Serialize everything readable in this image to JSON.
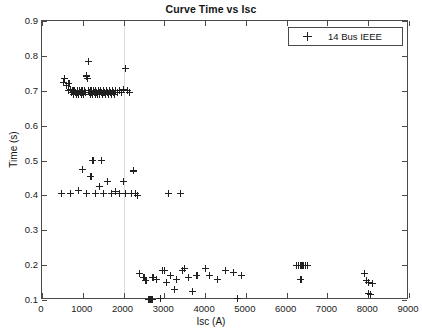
{
  "chart_data": {
    "type": "scatter",
    "title": "Curve Time vs Isc",
    "xlabel": "Isc (A)",
    "ylabel": "Time (s)",
    "xlim": [
      0,
      9000
    ],
    "ylim": [
      0.1,
      0.9
    ],
    "xticks": [
      0,
      1000,
      2000,
      3000,
      4000,
      5000,
      6000,
      7000,
      8000,
      9000
    ],
    "yticks": [
      0.1,
      0.2,
      0.3,
      0.4,
      0.5,
      0.6,
      0.7,
      0.8,
      0.9
    ],
    "xtick_labels": [
      "0",
      "1000",
      "2000",
      "3000",
      "4000",
      "5000",
      "6000",
      "7000",
      "8000",
      "9000"
    ],
    "ytick_labels": [
      "0.1",
      "0.2",
      "0.3",
      "0.4",
      "0.5",
      "0.6",
      "0.7",
      "0.8",
      "0.9"
    ],
    "grid": false,
    "gridlines_x": [
      2000
    ],
    "legend_position": "upper right",
    "marker": "+",
    "marker_color": "#202020",
    "series": [
      {
        "name": "14 Bus IEEE",
        "points": [
          [
            470,
            0.405
          ],
          [
            520,
            0.725
          ],
          [
            560,
            0.735
          ],
          [
            600,
            0.715
          ],
          [
            640,
            0.7
          ],
          [
            660,
            0.72
          ],
          [
            700,
            0.705
          ],
          [
            700,
            0.405
          ],
          [
            730,
            0.695
          ],
          [
            760,
            0.7
          ],
          [
            780,
            0.69
          ],
          [
            800,
            0.7
          ],
          [
            820,
            0.695
          ],
          [
            840,
            0.69
          ],
          [
            860,
            0.7
          ],
          [
            880,
            0.695
          ],
          [
            900,
            0.69
          ],
          [
            900,
            0.415
          ],
          [
            920,
            0.7
          ],
          [
            940,
            0.695
          ],
          [
            960,
            0.69
          ],
          [
            980,
            0.7
          ],
          [
            1000,
            0.695
          ],
          [
            1000,
            0.475
          ],
          [
            1020,
            0.69
          ],
          [
            1040,
            0.7
          ],
          [
            1060,
            0.695
          ],
          [
            1080,
            0.74
          ],
          [
            1100,
            0.745
          ],
          [
            1100,
            0.405
          ],
          [
            1120,
            0.735
          ],
          [
            1140,
            0.7
          ],
          [
            1150,
            0.785
          ],
          [
            1160,
            0.695
          ],
          [
            1180,
            0.69
          ],
          [
            1200,
            0.7
          ],
          [
            1200,
            0.455
          ],
          [
            1220,
            0.695
          ],
          [
            1240,
            0.69
          ],
          [
            1250,
            0.5
          ],
          [
            1260,
            0.7
          ],
          [
            1280,
            0.695
          ],
          [
            1300,
            0.69
          ],
          [
            1300,
            0.405
          ],
          [
            1320,
            0.7
          ],
          [
            1340,
            0.695
          ],
          [
            1360,
            0.69
          ],
          [
            1380,
            0.7
          ],
          [
            1400,
            0.695
          ],
          [
            1400,
            0.425
          ],
          [
            1420,
            0.69
          ],
          [
            1440,
            0.7
          ],
          [
            1450,
            0.5
          ],
          [
            1460,
            0.695
          ],
          [
            1480,
            0.69
          ],
          [
            1500,
            0.7
          ],
          [
            1500,
            0.405
          ],
          [
            1520,
            0.695
          ],
          [
            1550,
            0.69
          ],
          [
            1580,
            0.7
          ],
          [
            1600,
            0.695
          ],
          [
            1600,
            0.44
          ],
          [
            1620,
            0.69
          ],
          [
            1650,
            0.7
          ],
          [
            1680,
            0.695
          ],
          [
            1700,
            0.69
          ],
          [
            1700,
            0.405
          ],
          [
            1720,
            0.7
          ],
          [
            1750,
            0.695
          ],
          [
            1780,
            0.69
          ],
          [
            1800,
            0.7
          ],
          [
            1800,
            0.41
          ],
          [
            1850,
            0.695
          ],
          [
            1900,
            0.7
          ],
          [
            1900,
            0.405
          ],
          [
            1950,
            0.695
          ],
          [
            2000,
            0.705
          ],
          [
            2000,
            0.44
          ],
          [
            2050,
            0.765
          ],
          [
            2050,
            0.405
          ],
          [
            2100,
            0.7
          ],
          [
            2150,
            0.695
          ],
          [
            2200,
            0.405
          ],
          [
            2250,
            0.47
          ],
          [
            2300,
            0.405
          ],
          [
            2350,
            0.4
          ],
          [
            2400,
            0.175
          ],
          [
            2500,
            0.165
          ],
          [
            2550,
            0.155
          ],
          [
            2600,
            0.102
          ],
          [
            2620,
            0.102
          ],
          [
            2640,
            0.102
          ],
          [
            2660,
            0.102
          ],
          [
            2680,
            0.102
          ],
          [
            2700,
            0.102
          ],
          [
            2720,
            0.165
          ],
          [
            2800,
            0.16
          ],
          [
            2900,
            0.105
          ],
          [
            2950,
            0.185
          ],
          [
            3000,
            0.185
          ],
          [
            3050,
            0.15
          ],
          [
            3100,
            0.405
          ],
          [
            3150,
            0.17
          ],
          [
            3250,
            0.13
          ],
          [
            3300,
            0.16
          ],
          [
            3400,
            0.405
          ],
          [
            3450,
            0.185
          ],
          [
            3500,
            0.19
          ],
          [
            3600,
            0.165
          ],
          [
            3700,
            0.125
          ],
          [
            3800,
            0.17
          ],
          [
            4000,
            0.19
          ],
          [
            4100,
            0.17
          ],
          [
            4300,
            0.16
          ],
          [
            4500,
            0.185
          ],
          [
            4700,
            0.18
          ],
          [
            4800,
            0.105
          ],
          [
            4900,
            0.17
          ],
          [
            6250,
            0.2
          ],
          [
            6300,
            0.2
          ],
          [
            6350,
            0.2
          ],
          [
            6400,
            0.2
          ],
          [
            6450,
            0.2
          ],
          [
            6500,
            0.2
          ],
          [
            6350,
            0.16
          ],
          [
            7900,
            0.175
          ],
          [
            7950,
            0.155
          ],
          [
            8000,
            0.15
          ],
          [
            8000,
            0.118
          ],
          [
            8050,
            0.115
          ],
          [
            8100,
            0.148
          ]
        ]
      }
    ]
  },
  "legend": {
    "entries": [
      {
        "label": "14 Bus IEEE",
        "marker": "+"
      }
    ]
  }
}
